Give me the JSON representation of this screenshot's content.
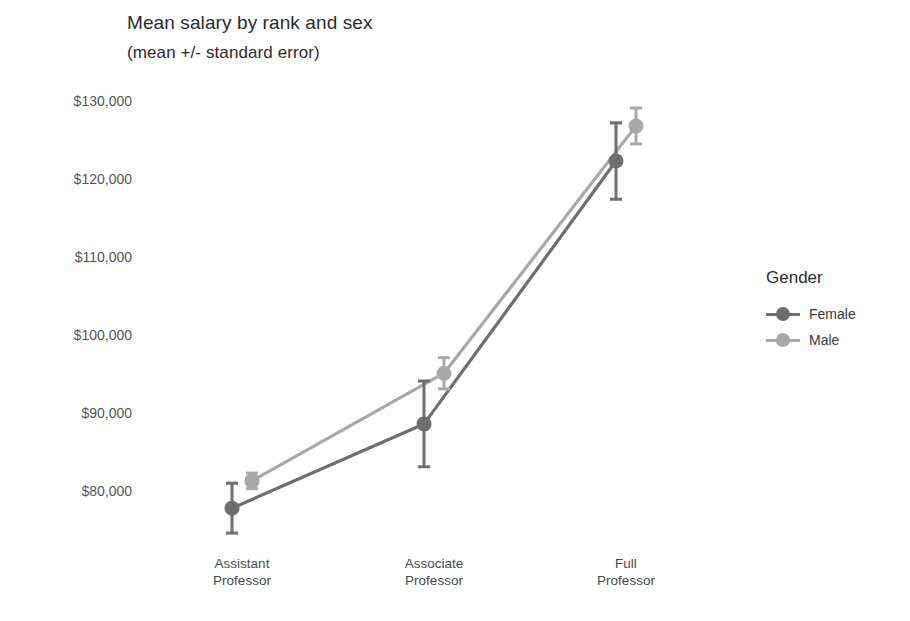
{
  "chart_data": {
    "type": "line",
    "title": "Mean salary by rank and sex",
    "subtitle": "(mean +/- standard error)",
    "xlabel": "",
    "ylabel": "",
    "categories": [
      "Assistant\nProfessor",
      "Associate\nProfessor",
      "Full\nProfessor"
    ],
    "category_lines": [
      [
        "Assistant",
        "Professor"
      ],
      [
        "Associate",
        "Professor"
      ],
      [
        "Full",
        "Professor"
      ]
    ],
    "ylim": [
      75000,
      132000
    ],
    "yticks": [
      80000,
      90000,
      100000,
      110000,
      120000,
      130000
    ],
    "ytick_labels": [
      "$80,000",
      "$90,000",
      "$100,000",
      "$110,000",
      "$120,000",
      "$130,000"
    ],
    "grid": false,
    "legend": {
      "title": "Gender",
      "position": "right",
      "entries": [
        "Female",
        "Male"
      ]
    },
    "error_type": "standard error",
    "series": [
      {
        "name": "Female",
        "color": "#6e6e6e",
        "values": [
          77800,
          88600,
          122300
        ],
        "errors": [
          3200,
          5500,
          4900
        ]
      },
      {
        "name": "Male",
        "color": "#a8a8a8",
        "values": [
          81300,
          95100,
          126800
        ],
        "errors": [
          1000,
          2000,
          2300
        ]
      }
    ]
  },
  "colors": {
    "female": "#6e6e6e",
    "male": "#a8a8a8",
    "text": "#3a3a3a",
    "tick_text": "#555555",
    "background": "#ffffff"
  }
}
